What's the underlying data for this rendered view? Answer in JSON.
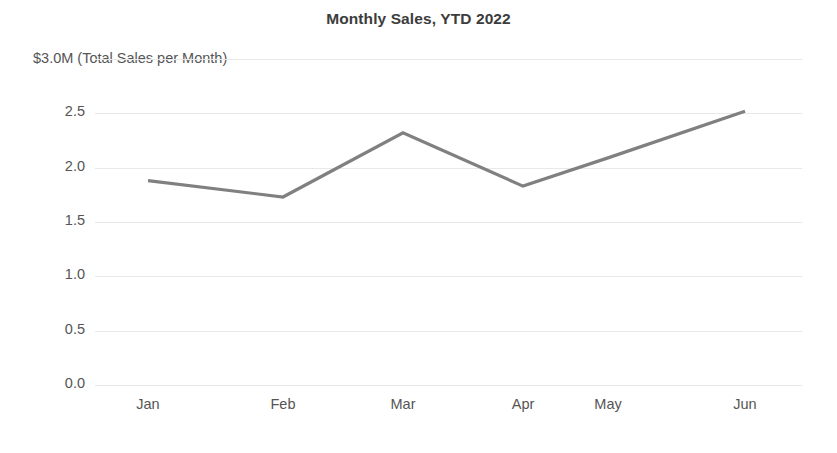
{
  "chart_data": {
    "type": "line",
    "title": "Monthly Sales, YTD 2022",
    "axis_note": "$3.0M (Total Sales per Month)",
    "xlabel": "",
    "ylabel": "Total Sales per Month",
    "unit": "$M",
    "categories": [
      "Jan",
      "Feb",
      "Mar",
      "Apr",
      "May",
      "Jun"
    ],
    "values": [
      1.88,
      1.73,
      2.32,
      1.83,
      2.09,
      2.52
    ],
    "series": [
      {
        "name": "Total Sales per Month",
        "values": [
          1.88,
          1.73,
          2.32,
          1.83,
          2.09,
          2.52
        ]
      }
    ],
    "ylim": [
      0.0,
      3.0
    ],
    "ytick_labels": [
      "2.5",
      "2.0",
      "1.5",
      "1.0",
      "0.5",
      "0.0"
    ],
    "ytick_values": [
      2.5,
      2.0,
      1.5,
      1.0,
      0.5,
      0.0
    ],
    "gridline_values": [
      3.0,
      2.5,
      2.0,
      1.5,
      1.0,
      0.5,
      0.0
    ],
    "grid": true,
    "legend": "none",
    "line_color": "#808080",
    "grid_color": "#e8e8e8",
    "text_color": "#555555",
    "title_color": "#3c3c3c",
    "background": "#ffffff"
  }
}
